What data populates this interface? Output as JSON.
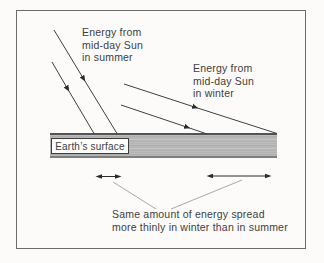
{
  "figure": {
    "summer_label": [
      "Energy from",
      "mid-day Sun",
      "in summer"
    ],
    "winter_label": [
      "Energy from",
      "mid-day Sun",
      "in winter"
    ],
    "surface_label": "Earth’s surface",
    "caption": [
      "Same amount of energy spread",
      "more thinly in winter than in summer"
    ],
    "colors": {
      "ray": "#3f3f3f",
      "arrowhead": "#2b2b2b",
      "leader": "#a8a8a8",
      "frame": "#6b6b6b",
      "band_fill": "#b7b7b7",
      "band_edge_top": "#545454",
      "band_edge_bottom": "#7e7e7e",
      "text": "#404040",
      "background": "#fcfbf9"
    }
  }
}
